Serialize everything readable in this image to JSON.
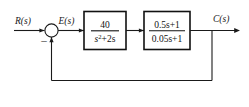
{
  "figure": {
    "type": "control-system-block-diagram",
    "background_color": "#ffffff",
    "line_color": "#1a1a1a",
    "width": 249,
    "height": 107
  },
  "signals": {
    "input_label": "R(s)",
    "error_label": "E(s)",
    "output_label": "C(s)"
  },
  "summing_junction": {
    "name": "summing-junction",
    "input_sign": "+",
    "feedback_sign": "−",
    "feedback_sign_display": "–"
  },
  "blocks": [
    {
      "id": "plant-block",
      "numerator": "40",
      "denominator_base": "s",
      "denominator_exponent": "2",
      "denominator_tail": "+2s",
      "denominator_full": "s²+2s",
      "transfer_function": "40/(s²+2s)"
    },
    {
      "id": "compensator-block",
      "numerator": "0.5s+1",
      "denominator": "0.05s+1",
      "transfer_function": "(0.5s+1)/(0.05s+1)"
    }
  ],
  "feedback": {
    "path": "unity-feedback",
    "description": "unity feedback from output takeoff to summing junction"
  }
}
